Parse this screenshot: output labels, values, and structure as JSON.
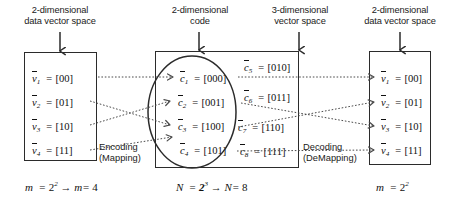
{
  "headers": {
    "left": {
      "line1": "2-dimensional",
      "line2": "data vector space"
    },
    "code": {
      "line1": "2-dimensional",
      "line2": "code"
    },
    "middle": {
      "line1": "3-dimensional",
      "line2": "vector space"
    },
    "right": {
      "line1": "2-dimensional",
      "line2": "data vector space"
    }
  },
  "left_box": {
    "items": [
      {
        "name": "v",
        "index": "1",
        "value": "[00]"
      },
      {
        "name": "v",
        "index": "2",
        "value": "[01]"
      },
      {
        "name": "v",
        "index": "3",
        "value": "[10]"
      },
      {
        "name": "v",
        "index": "4",
        "value": "[11]"
      }
    ],
    "caption": "m = 2² → m = 4",
    "caption_parts": {
      "lhs": "m",
      "base": "2",
      "exp": "2",
      "arrow": "→",
      "rhs": "m",
      "result": "4"
    }
  },
  "code_box": {
    "codewords": [
      {
        "name": "c",
        "index": "1",
        "value": "[000]"
      },
      {
        "name": "c",
        "index": "2",
        "value": "[001]"
      },
      {
        "name": "c",
        "index": "3",
        "value": "[100]"
      },
      {
        "name": "c",
        "index": "4",
        "value": "[101]"
      }
    ],
    "non_codewords": [
      {
        "name": "c",
        "index": "5",
        "value": "[010]"
      },
      {
        "name": "c",
        "index": "6",
        "value": "[011]"
      },
      {
        "name": "c",
        "index": "7",
        "value": "[110]"
      },
      {
        "name": "c",
        "index": "8",
        "value": "[111]"
      }
    ],
    "caption_parts": {
      "lhs": "N",
      "base": "2",
      "exp": "3",
      "arrow": "→",
      "rhs": "N",
      "result": "8"
    }
  },
  "right_box": {
    "items": [
      {
        "name": "v",
        "index": "1",
        "value": "[00]"
      },
      {
        "name": "v",
        "index": "2",
        "value": "[01]"
      },
      {
        "name": "v",
        "index": "3",
        "value": "[10]"
      },
      {
        "name": "v",
        "index": "4",
        "value": "[11]"
      }
    ],
    "caption_parts": {
      "lhs": "m",
      "base": "2",
      "exp": "2"
    }
  },
  "process_labels": {
    "encoding": {
      "line1": "Encoding",
      "line2": "(Mapping)"
    },
    "decoding": {
      "line1": "Decoding",
      "line2": "(DeMapping)"
    }
  },
  "mapping": {
    "encode": [
      {
        "from": 1,
        "to": 1
      },
      {
        "from": 2,
        "to": 3
      },
      {
        "from": 3,
        "to": 2
      },
      {
        "from": 4,
        "to": 4
      }
    ],
    "decode": [
      {
        "from": 1,
        "to": 1
      },
      {
        "from": 2,
        "to": 3
      },
      {
        "from": 3,
        "to": 2
      },
      {
        "from": 4,
        "to": 4
      }
    ]
  },
  "colors": {
    "stroke": "#2b2b2b",
    "wire": "#5a5a5a",
    "text": "#1a1a1a",
    "background": "#ffffff"
  }
}
